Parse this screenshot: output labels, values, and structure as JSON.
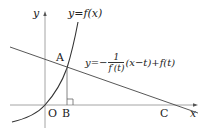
{
  "diagram": {
    "labels": {
      "y_axis": "y",
      "x_axis": "x",
      "origin": "O",
      "point_a": "A",
      "point_b": "B",
      "point_c": "C",
      "curve": "y=f(x)",
      "line_lhs": "y=−",
      "line_frac_num": "1",
      "line_frac_den": "f′(t)",
      "line_rhs": "(x−t)+f(t)"
    },
    "colors": {
      "axis": "#9a9a9a",
      "curve": "#333333",
      "line": "#444444",
      "text": "#222222"
    }
  }
}
